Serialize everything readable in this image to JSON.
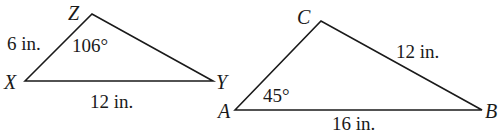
{
  "diagram": {
    "type": "similar-triangles-comparison",
    "triangles": [
      {
        "id": "XYZ",
        "vertices": {
          "X": {
            "label": "X",
            "x": 25,
            "y": 81
          },
          "Y": {
            "label": "Y",
            "x": 213,
            "y": 81
          },
          "Z": {
            "label": "Z",
            "x": 92,
            "y": 14
          }
        },
        "side_labels": {
          "XZ": "6 in.",
          "XY": "12 in."
        },
        "angle_labels": {
          "Z": "106°"
        }
      },
      {
        "id": "ABC",
        "vertices": {
          "A": {
            "label": "A",
            "x": 235,
            "y": 110
          },
          "B": {
            "label": "B",
            "x": 482,
            "y": 110
          },
          "C": {
            "label": "C",
            "x": 321,
            "y": 21
          }
        },
        "side_labels": {
          "CB": "12 in.",
          "AB": "16 in."
        },
        "angle_labels": {
          "A": "45°"
        }
      }
    ]
  },
  "labels": {
    "t1": {
      "X": "X",
      "Y": "Y",
      "Z": "Z",
      "side_xz": "6 in.",
      "side_xy": "12 in.",
      "angle_z": "106°"
    },
    "t2": {
      "A": "A",
      "B": "B",
      "C": "C",
      "side_cb": "12 in.",
      "side_ab": "16 in.",
      "angle_a": "45°"
    }
  },
  "colors": {
    "stroke": "#1a1a1a",
    "background": "#ffffff"
  }
}
